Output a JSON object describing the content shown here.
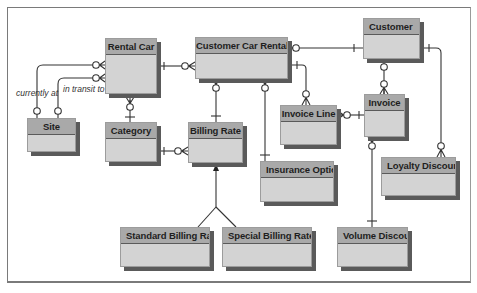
{
  "diagram": {
    "type": "entity-relationship",
    "colors": {
      "header": "#a9a9a9",
      "body": "#d3d3d3",
      "shadow": "#5a5a5a",
      "line": "#333333"
    },
    "entities": {
      "rental_car": "Rental Car",
      "customer_car_rental": "Customer Car Rental",
      "customer": "Customer",
      "site": "Site",
      "category": "Category",
      "billing_rate": "Billing Rate",
      "invoice_line": "Invoice Line",
      "invoice": "Invoice",
      "insurance_option": "Insurance Option",
      "loyalty_discount": "Loyalty Discount",
      "standard_billing_rate": "Standard Billing Rate",
      "special_billing_rate": "Special Billing Rate",
      "volume_discount": "Volume Discount"
    },
    "relationship_labels": {
      "currently_at": "currently at",
      "in_transit_to": "in transit to"
    },
    "relationships": [
      {
        "from": "Site",
        "to": "Rental Car",
        "label": "currently at",
        "from_card": "zero-or-one",
        "to_card": "zero-or-many"
      },
      {
        "from": "Site",
        "to": "Rental Car",
        "label": "in transit to",
        "from_card": "zero-or-one",
        "to_card": "zero-or-many"
      },
      {
        "from": "Rental Car",
        "to": "Customer Car Rental",
        "from_card": "one",
        "to_card": "zero-or-many"
      },
      {
        "from": "Category",
        "to": "Rental Car",
        "from_card": "one",
        "to_card": "zero-or-many"
      },
      {
        "from": "Category",
        "to": "Billing Rate",
        "from_card": "one",
        "to_card": "zero-or-many"
      },
      {
        "from": "Billing Rate",
        "to": "Customer Car Rental",
        "from_card": "one",
        "to_card": "zero-or-many"
      },
      {
        "from": "Insurance Option",
        "to": "Customer Car Rental",
        "from_card": "one",
        "to_card": "zero-or-many"
      },
      {
        "from": "Customer",
        "to": "Customer Car Rental",
        "from_card": "one",
        "to_card": "zero-or-many"
      },
      {
        "from": "Customer Car Rental",
        "to": "Invoice Line",
        "from_card": "one",
        "to_card": "zero-or-many"
      },
      {
        "from": "Invoice",
        "to": "Invoice Line",
        "from_card": "one",
        "to_card": "zero-or-many"
      },
      {
        "from": "Customer",
        "to": "Invoice",
        "from_card": "zero-or-one",
        "to_card": "zero-or-many"
      },
      {
        "from": "Customer",
        "to": "Loyalty Discount",
        "from_card": "one",
        "to_card": "zero-or-many"
      },
      {
        "from": "Volume Discount",
        "to": "Invoice",
        "from_card": "one",
        "to_card": "zero-or-many"
      },
      {
        "from": "Standard Billing Rate",
        "to": "Billing Rate",
        "type": "subtype"
      },
      {
        "from": "Special Billing Rate",
        "to": "Billing Rate",
        "type": "subtype"
      }
    ]
  }
}
